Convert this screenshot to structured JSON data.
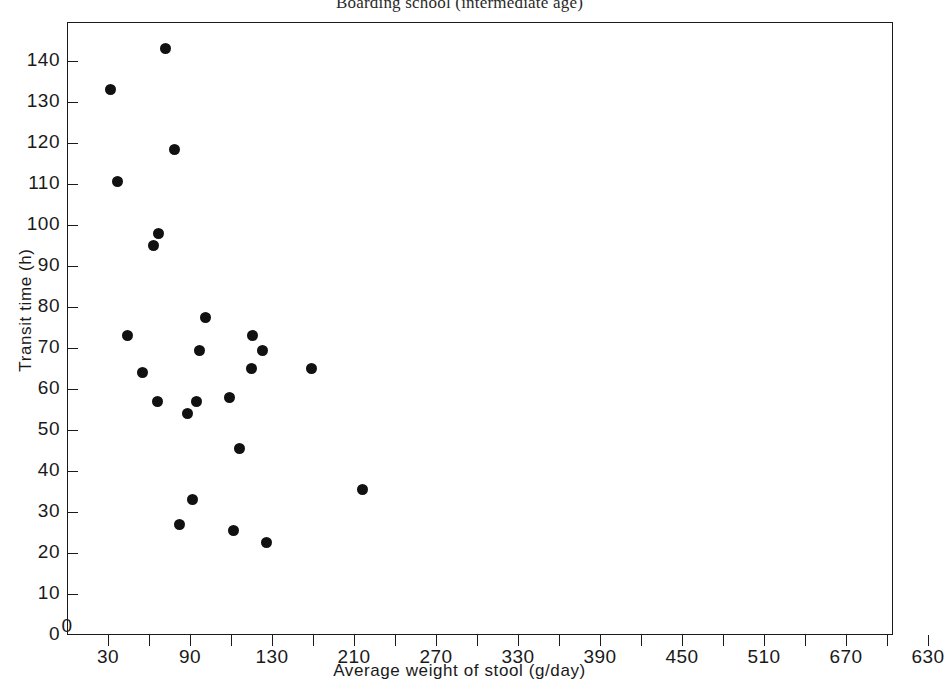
{
  "chart_data": {
    "type": "scatter",
    "title": "Boarding school (intermediate age)",
    "xlabel": "Average weight of stool (g/day)",
    "ylabel": "Transit time (h)",
    "xlim": [
      0,
      630
    ],
    "ylim": [
      0,
      145
    ],
    "grid": false,
    "legend": "none",
    "marker": {
      "shape": "circle",
      "color": "#111111",
      "size_px": 11
    },
    "x_ticks": [
      {
        "value": 0,
        "label": "0",
        "major": true
      },
      {
        "value": 30,
        "label": "30",
        "major": true
      },
      {
        "value": 60,
        "label": "",
        "major": false
      },
      {
        "value": 90,
        "label": "90",
        "major": true
      },
      {
        "value": 120,
        "label": "",
        "major": false
      },
      {
        "value": 150,
        "label": "130",
        "major": true
      },
      {
        "value": 180,
        "label": "",
        "major": false
      },
      {
        "value": 210,
        "label": "210",
        "major": true
      },
      {
        "value": 240,
        "label": "",
        "major": false
      },
      {
        "value": 270,
        "label": "270",
        "major": true
      },
      {
        "value": 300,
        "label": "",
        "major": false
      },
      {
        "value": 330,
        "label": "330",
        "major": true
      },
      {
        "value": 360,
        "label": "",
        "major": false
      },
      {
        "value": 390,
        "label": "390",
        "major": true
      },
      {
        "value": 420,
        "label": "",
        "major": false
      },
      {
        "value": 450,
        "label": "450",
        "major": true
      },
      {
        "value": 480,
        "label": "",
        "major": false
      },
      {
        "value": 510,
        "label": "510",
        "major": true
      },
      {
        "value": 540,
        "label": "",
        "major": false
      },
      {
        "value": 570,
        "label": "670",
        "major": true
      },
      {
        "value": 600,
        "label": "",
        "major": false
      },
      {
        "value": 630,
        "label": "630",
        "major": true
      }
    ],
    "y_ticks": [
      {
        "value": 0,
        "label": "0"
      },
      {
        "value": 10,
        "label": "10"
      },
      {
        "value": 20,
        "label": "20"
      },
      {
        "value": 30,
        "label": "30"
      },
      {
        "value": 40,
        "label": "40"
      },
      {
        "value": 50,
        "label": "50"
      },
      {
        "value": 60,
        "label": "60"
      },
      {
        "value": 70,
        "label": "70"
      },
      {
        "value": 80,
        "label": "80"
      },
      {
        "value": 90,
        "label": "90"
      },
      {
        "value": 100,
        "label": "100"
      },
      {
        "value": 110,
        "label": "110"
      },
      {
        "value": 120,
        "label": "120"
      },
      {
        "value": 130,
        "label": "130"
      },
      {
        "value": 140,
        "label": "140"
      }
    ],
    "points": [
      {
        "x": 72,
        "y": 143
      },
      {
        "x": 32,
        "y": 133
      },
      {
        "x": 79,
        "y": 118.5
      },
      {
        "x": 37,
        "y": 110.5
      },
      {
        "x": 67,
        "y": 98
      },
      {
        "x": 63,
        "y": 95
      },
      {
        "x": 44,
        "y": 73
      },
      {
        "x": 101,
        "y": 77.5
      },
      {
        "x": 136,
        "y": 73
      },
      {
        "x": 143,
        "y": 69.5
      },
      {
        "x": 97,
        "y": 69.5
      },
      {
        "x": 179,
        "y": 65
      },
      {
        "x": 135,
        "y": 65
      },
      {
        "x": 55,
        "y": 64
      },
      {
        "x": 119,
        "y": 58
      },
      {
        "x": 95,
        "y": 57
      },
      {
        "x": 66,
        "y": 57
      },
      {
        "x": 88,
        "y": 54
      },
      {
        "x": 126,
        "y": 45.5
      },
      {
        "x": 216,
        "y": 35.5
      },
      {
        "x": 92,
        "y": 33
      },
      {
        "x": 82,
        "y": 27
      },
      {
        "x": 122,
        "y": 25.5
      },
      {
        "x": 146,
        "y": 22.5
      }
    ]
  }
}
